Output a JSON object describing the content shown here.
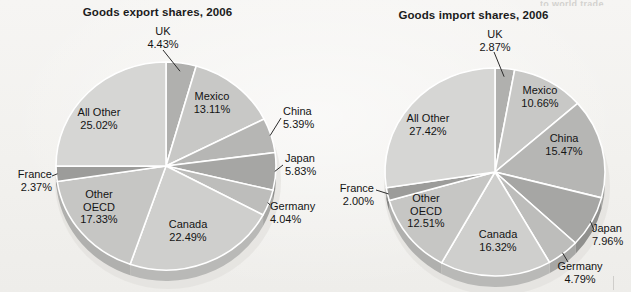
{
  "page": {
    "background_color": "#f4f3f1",
    "clipped_header_text": "to world trade"
  },
  "charts": [
    {
      "id": "goods-export-shares",
      "title": "Goods export shares, 2006"
    },
    {
      "id": "goods-import-shares",
      "title": "Goods import shares, 2006"
    }
  ],
  "chart_data": [
    {
      "type": "pie",
      "title": "Goods export shares, 2006",
      "xlabel": "",
      "ylabel": "",
      "legend": "none",
      "start_angle_deg": 0,
      "direction": "clockwise",
      "categories": [
        "UK",
        "Mexico",
        "China",
        "Japan",
        "Germany",
        "Canada",
        "Other OECD",
        "France",
        "All Other"
      ],
      "values": [
        4.43,
        13.11,
        5.39,
        5.83,
        4.04,
        22.49,
        17.33,
        2.37,
        25.02
      ],
      "labels": [
        {
          "name": "UK",
          "value": "4.43%",
          "placement": "outside-top"
        },
        {
          "name": "Mexico",
          "value": "13.11%",
          "placement": "inside"
        },
        {
          "name": "China",
          "value": "5.39%",
          "placement": "outside-right"
        },
        {
          "name": "Japan",
          "value": "5.83%",
          "placement": "outside-right"
        },
        {
          "name": "Germany",
          "value": "4.04%",
          "placement": "outside-right"
        },
        {
          "name": "Canada",
          "value": "22.49%",
          "placement": "inside"
        },
        {
          "name": "Other OECD",
          "value": "17.33%",
          "placement": "inside"
        },
        {
          "name": "France",
          "value": "2.37%",
          "placement": "outside-left"
        },
        {
          "name": "All Other",
          "value": "25.02%",
          "placement": "inside"
        }
      ],
      "slice_colors": [
        "#b0b0ae",
        "#c8c8c6",
        "#b6b6b4",
        "#a6a6a4",
        "#bdbdbb",
        "#cfcfcd",
        "#c6c6c4",
        "#9c9c9a",
        "#d6d6d4"
      ]
    },
    {
      "type": "pie",
      "title": "Goods import shares, 2006",
      "xlabel": "",
      "ylabel": "",
      "legend": "none",
      "start_angle_deg": 0,
      "direction": "clockwise",
      "categories": [
        "UK",
        "Mexico",
        "China",
        "Japan",
        "Germany",
        "Canada",
        "Other OECD",
        "France",
        "All Other"
      ],
      "values": [
        2.87,
        10.66,
        15.47,
        7.96,
        4.79,
        16.32,
        12.51,
        2.0,
        27.42
      ],
      "labels": [
        {
          "name": "UK",
          "value": "2.87%",
          "placement": "outside-top"
        },
        {
          "name": "Mexico",
          "value": "10.66%",
          "placement": "inside"
        },
        {
          "name": "China",
          "value": "15.47%",
          "placement": "inside"
        },
        {
          "name": "Japan",
          "value": "7.96%",
          "placement": "outside-right"
        },
        {
          "name": "Germany",
          "value": "4.79%",
          "placement": "outside-right"
        },
        {
          "name": "Canada",
          "value": "16.32%",
          "placement": "inside"
        },
        {
          "name": "Other OECD",
          "value": "12.51%",
          "placement": "inside"
        },
        {
          "name": "France",
          "value": "2.00%",
          "placement": "outside-left"
        },
        {
          "name": "All Other",
          "value": "27.42%",
          "placement": "inside"
        }
      ],
      "slice_colors": [
        "#b0b0ae",
        "#c8c8c6",
        "#b6b6b4",
        "#a6a6a4",
        "#bdbdbb",
        "#cfcfcd",
        "#c6c6c4",
        "#9c9c9a",
        "#d6d6d4"
      ]
    }
  ]
}
